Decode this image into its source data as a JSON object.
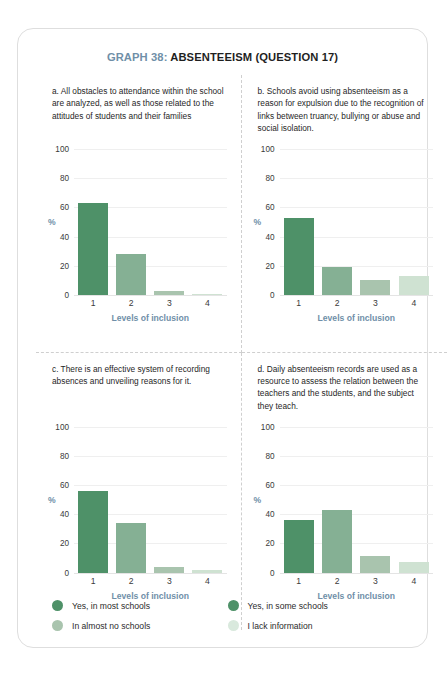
{
  "title": {
    "prefix": "GRAPH 38:",
    "main": " ABSENTEEISM (QUESTION 17)"
  },
  "axis": {
    "y_label": "%",
    "x_title": "Levels of inclusion",
    "y_ticks": [
      "100",
      "80",
      "60",
      "40",
      "20",
      "0"
    ],
    "x_ticks": [
      "1",
      "2",
      "3",
      "4"
    ]
  },
  "colors": {
    "level1": "#4e9168",
    "level2": "#85b094",
    "level3": "#a9c4ae",
    "level4": "#cfe2d2",
    "accent": "#6f8fa8",
    "border": "#dedede",
    "gridline": "#efefef"
  },
  "panels": [
    {
      "key": "a",
      "caption": "a. All obstacles to attendance within the school are analyzed, as well as those related to the attitudes of students and their families"
    },
    {
      "key": "b",
      "caption": "b. Schools avoid using absenteeism as a reason for expulsion due to the recognition of links between truancy, bullying or abuse and social isolation."
    },
    {
      "key": "c",
      "caption": "c. There is an effective system of recording absences and unveiling reasons for it."
    },
    {
      "key": "d",
      "caption": "d. Daily absenteeism records are used as a resource to assess the relation between the teachers and the students, and the subject they teach."
    }
  ],
  "legend": [
    {
      "label": "Yes, in most schools",
      "color": "#4e9168"
    },
    {
      "label": "Yes, in some schools",
      "color": "#4e9168"
    },
    {
      "label": "In almost no schools",
      "color": "#a9c4ae"
    },
    {
      "label": "I lack information",
      "color": "#d9e9dd"
    }
  ],
  "chart_data": [
    {
      "type": "bar",
      "title": "a. All obstacles to attendance within the school are analyzed, as well as those related to the attitudes of students and their families",
      "categories": [
        "1",
        "2",
        "3",
        "4"
      ],
      "values": [
        63,
        28,
        3,
        1
      ],
      "xlabel": "Levels of inclusion",
      "ylabel": "%",
      "ylim": [
        0,
        100
      ],
      "yticks": [
        0,
        20,
        40,
        60,
        80,
        100
      ],
      "grid": true,
      "legend_position": "bottom",
      "colors": [
        "#4e9168",
        "#85b094",
        "#a9c4ae",
        "#cfe2d2"
      ]
    },
    {
      "type": "bar",
      "title": "b. Schools avoid using absenteeism as a reason for expulsion due to the recognition of links between truancy, bullying or abuse and social isolation.",
      "categories": [
        "1",
        "2",
        "3",
        "4"
      ],
      "values": [
        53,
        19,
        10,
        13
      ],
      "xlabel": "Levels of inclusion",
      "ylabel": "%",
      "ylim": [
        0,
        100
      ],
      "yticks": [
        0,
        20,
        40,
        60,
        80,
        100
      ],
      "grid": true,
      "legend_position": "bottom",
      "colors": [
        "#4e9168",
        "#85b094",
        "#a9c4ae",
        "#cfe2d2"
      ]
    },
    {
      "type": "bar",
      "title": "c. There is an effective system of recording absences and unveiling reasons for it.",
      "categories": [
        "1",
        "2",
        "3",
        "4"
      ],
      "values": [
        56,
        34,
        4,
        2
      ],
      "xlabel": "Levels of inclusion",
      "ylabel": "%",
      "ylim": [
        0,
        100
      ],
      "yticks": [
        0,
        20,
        40,
        60,
        80,
        100
      ],
      "grid": true,
      "legend_position": "bottom",
      "colors": [
        "#4e9168",
        "#85b094",
        "#a9c4ae",
        "#cfe2d2"
      ]
    },
    {
      "type": "bar",
      "title": "d. Daily absenteeism records are used as a resource to assess the relation between the teachers and the students, and the subject they teach.",
      "categories": [
        "1",
        "2",
        "3",
        "4"
      ],
      "values": [
        36,
        43,
        11,
        7
      ],
      "xlabel": "Levels of inclusion",
      "ylabel": "%",
      "ylim": [
        0,
        100
      ],
      "yticks": [
        0,
        20,
        40,
        60,
        80,
        100
      ],
      "grid": true,
      "legend_position": "bottom",
      "colors": [
        "#4e9168",
        "#85b094",
        "#a9c4ae",
        "#cfe2d2"
      ]
    }
  ]
}
